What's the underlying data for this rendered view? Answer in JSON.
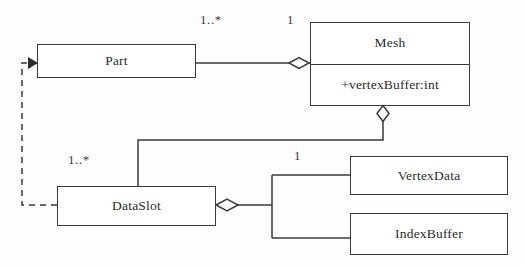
{
  "diagram": {
    "stroke_color": "#3a3a3a",
    "fill_color": "#ffffff",
    "text_color": "#2b2b2b",
    "background_color": "#fdfdfd",
    "classes": [
      {
        "id": "part",
        "name": "Part",
        "attributes": []
      },
      {
        "id": "mesh",
        "name": "Mesh",
        "attributes": [
          "+vertexBuffer:int"
        ]
      },
      {
        "id": "dataslot",
        "name": "DataSlot",
        "attributes": []
      },
      {
        "id": "vertexdata",
        "name": "VertexData",
        "attributes": []
      },
      {
        "id": "indexbuffer",
        "name": "IndexBuffer",
        "attributes": []
      }
    ],
    "multiplicities": [
      {
        "id": "part-mesh-source",
        "label": "1..*"
      },
      {
        "id": "part-mesh-target",
        "label": "1"
      },
      {
        "id": "mesh-dataslot-source",
        "label": "1..*"
      },
      {
        "id": "dataslot-data-target",
        "label": "1"
      }
    ],
    "relationships": [
      {
        "id": "part-mesh",
        "type": "aggregation",
        "from": "Part",
        "to": "Mesh",
        "source_multiplicity": "1..*",
        "target_multiplicity": "1"
      },
      {
        "id": "mesh-dataslot",
        "type": "aggregation",
        "from": "DataSlot",
        "to": "Mesh",
        "source_multiplicity": "1..*",
        "target_multiplicity": ""
      },
      {
        "id": "dataslot-vertexdata",
        "type": "aggregation",
        "from": "VertexData",
        "to": "DataSlot",
        "source_multiplicity": "",
        "target_multiplicity": "1"
      },
      {
        "id": "dataslot-indexbuffer",
        "type": "aggregation",
        "from": "IndexBuffer",
        "to": "DataSlot",
        "source_multiplicity": "",
        "target_multiplicity": ""
      },
      {
        "id": "dataslot-part",
        "type": "dependency",
        "from": "DataSlot",
        "to": "Part",
        "source_multiplicity": "",
        "target_multiplicity": ""
      }
    ]
  }
}
